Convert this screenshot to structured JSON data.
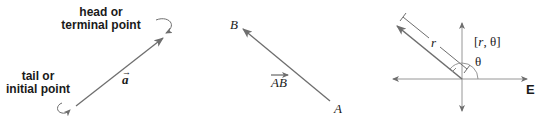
{
  "panels": [
    {
      "id": "vector-a",
      "head_label_line1": "head or",
      "head_label_line2": "terminal point",
      "tail_label_line1": "tail or",
      "tail_label_line2": "initial point",
      "vector_label": "a",
      "vector_label_accent": "→"
    },
    {
      "id": "vector-AB",
      "point_start": "A",
      "point_end": "B",
      "vector_label": "AB"
    },
    {
      "id": "polar-vector",
      "coord_label": "[r, θ]",
      "coord_open": "[",
      "coord_r": "r",
      "coord_rest": ", θ]",
      "magnitude_label": "r",
      "angle_label": "θ",
      "axis_label": "E"
    }
  ],
  "colors": {
    "line": "#6e6e6e",
    "text": "#1a1a1a"
  }
}
